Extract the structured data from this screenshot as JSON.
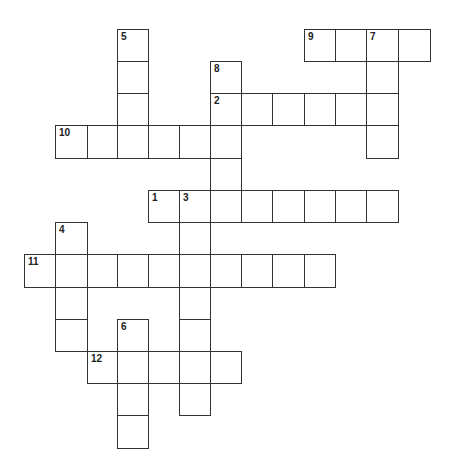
{
  "puzzle": {
    "type": "crossword",
    "cell_size": {
      "w": 32,
      "h": 33
    },
    "columns_x": [
      24,
      55,
      87,
      117,
      148,
      179,
      210,
      241,
      272,
      304,
      335,
      366,
      398
    ],
    "rows_y": [
      29,
      61,
      93,
      125,
      158,
      190,
      222,
      254,
      287,
      319,
      351,
      383,
      415
    ],
    "words": [
      {
        "number": "1",
        "direction": "across",
        "row": 5,
        "col": 4,
        "length": 8
      },
      {
        "number": "2",
        "direction": "across",
        "row": 2,
        "col": 6,
        "length": 6
      },
      {
        "number": "3",
        "direction": "down",
        "row": 5,
        "col": 5,
        "length": 7
      },
      {
        "number": "4",
        "direction": "down",
        "row": 6,
        "col": 1,
        "length": 4
      },
      {
        "number": "5",
        "direction": "down",
        "row": 0,
        "col": 3,
        "length": 4
      },
      {
        "number": "6",
        "direction": "down",
        "row": 9,
        "col": 3,
        "length": 4
      },
      {
        "number": "7",
        "direction": "down",
        "row": 0,
        "col": 11,
        "length": 4
      },
      {
        "number": "8",
        "direction": "down",
        "row": 1,
        "col": 6,
        "length": 5
      },
      {
        "number": "9",
        "direction": "across",
        "row": 0,
        "col": 9,
        "length": 4
      },
      {
        "number": "10",
        "direction": "across",
        "row": 3,
        "col": 1,
        "length": 6
      },
      {
        "number": "11",
        "direction": "across",
        "row": 7,
        "col": 0,
        "length": 10
      },
      {
        "number": "12",
        "direction": "across",
        "row": 10,
        "col": 2,
        "length": 5
      }
    ],
    "colors": {
      "line": "#333333",
      "background": "#ffffff",
      "number": "#222222"
    }
  }
}
